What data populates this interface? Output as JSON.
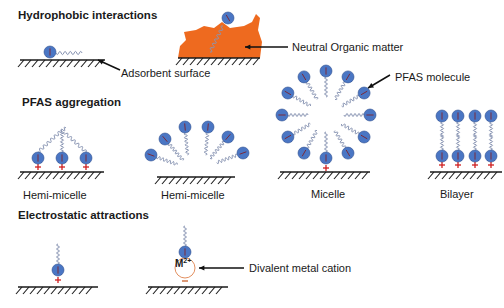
{
  "sections": {
    "hydrophobic": {
      "title": "Hydrophobic interactions"
    },
    "aggregation": {
      "title": "PFAS aggregation"
    },
    "electrostatic": {
      "title": "Electrostatic attractions"
    }
  },
  "annotations": {
    "adsorbent_surface": "Adsorbent surface",
    "neutral_organic_matter": "Neutral Organic matter",
    "pfas_molecule": "PFAS molecule",
    "divalent_metal_cation": "Divalent metal cation",
    "metal_symbol": "M",
    "metal_charge": "2+"
  },
  "structure_labels": {
    "hemi_micelle_1": "Hemi-micelle",
    "hemi_micelle_2": "Hemi-micelle",
    "micelle": "Micelle",
    "bilayer": "Bilayer"
  },
  "colors": {
    "head_fill": "#4a76c4",
    "head_stroke": "#2f4f8f",
    "tail": "#8a96b4",
    "organic_matter": "#ee6a1f",
    "positive_charge": "#d02020",
    "negative_charge": "#c8602a",
    "surface": "#1a1a1a",
    "text": "#1a1a1a",
    "cation_ring": "#e39060"
  }
}
